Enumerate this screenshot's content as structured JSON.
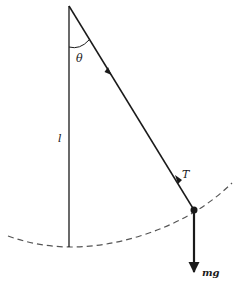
{
  "figure": {
    "type": "simple-pendulum-free-body-diagram",
    "labels": {
      "angle": "θ",
      "length": "l",
      "tension": "T",
      "weight": "mg"
    },
    "colors": {
      "stroke": "#1a1a1a",
      "background": "#ffffff"
    }
  }
}
